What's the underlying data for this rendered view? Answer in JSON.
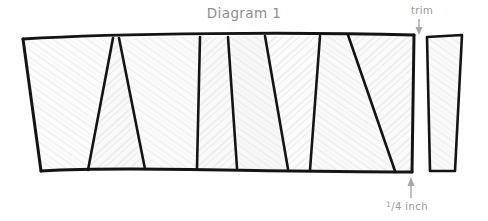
{
  "page": {
    "title": "Diagram 1",
    "background_color": "#ffffff"
  },
  "labels": {
    "title": "Diagram 1",
    "trim": "trim",
    "measurement": "¼ inch",
    "measurement_numerator": "1",
    "measurement_slash": "/",
    "measurement_denominator": "4",
    "measurement_unit": "inch",
    "text_color": "#9a9a9a"
  },
  "annotations": [
    {
      "name": "trim-arrow",
      "label": "trim",
      "direction": "down",
      "points_to": "gap between main panel and trim strip"
    },
    {
      "name": "quarter-inch-arrow",
      "label": "¼ inch",
      "direction": "up",
      "points_to": "narrow right edge segment of main panel"
    }
  ],
  "drawing": {
    "stroke_color": "#1a1a1a",
    "fill_light": "#f0f0f0",
    "fill_medium": "#e0e0e0",
    "fill_dark": "#d4d4d4",
    "arrow_color": "#a8a8a8",
    "style": "hand-drawn pencil sketch",
    "description": "A long horizontal quilting panel divided by slanted lines into alternating trapezoid wedges, plus a separate narrow trim strip at the right.",
    "main_panel": {
      "name": "main-panel",
      "top_edge": "slightly bowed upward band from x=22 to x=415",
      "bottom_edge": "slightly wavy band from x=40 to x=412",
      "wedge_count": 8
    },
    "trim_strip": {
      "name": "trim-strip",
      "x_range": [
        425,
        462
      ],
      "shape": "narrow tapered quadrilateral, wider at top"
    }
  }
}
